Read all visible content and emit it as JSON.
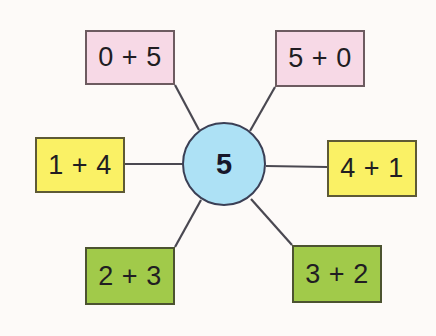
{
  "diagram": {
    "background_color": "#fdfaf8",
    "center": {
      "label": "5",
      "fill_color": "#ade1f5",
      "border_color": "#3b3f55",
      "cx": 224,
      "cy": 164,
      "r": 42
    },
    "edge_color": "#4a4851",
    "nodes": [
      {
        "id": "top-left",
        "label": "0 + 5",
        "addends": [
          0,
          5
        ],
        "sum": 5,
        "fill_color": "#f7d9e6",
        "border_color": "#6d5b60",
        "color_name": "pink",
        "x": 85,
        "y": 30,
        "w": 90,
        "h": 55
      },
      {
        "id": "top-right",
        "label": "5 + 0",
        "addends": [
          5,
          0
        ],
        "sum": 5,
        "fill_color": "#f7d9e6",
        "border_color": "#6d5b60",
        "color_name": "pink",
        "x": 275,
        "y": 30,
        "w": 90,
        "h": 57
      },
      {
        "id": "middle-left",
        "label": "1 + 4",
        "addends": [
          1,
          4
        ],
        "sum": 5,
        "fill_color": "#faf165",
        "border_color": "#5e5a35",
        "color_name": "yellow",
        "x": 35,
        "y": 137,
        "w": 90,
        "h": 56
      },
      {
        "id": "middle-right",
        "label": "4 + 1",
        "addends": [
          4,
          1
        ],
        "sum": 5,
        "fill_color": "#faf165",
        "border_color": "#5e5a35",
        "color_name": "yellow",
        "x": 327,
        "y": 140,
        "w": 90,
        "h": 57
      },
      {
        "id": "bottom-left",
        "label": "2 + 3",
        "addends": [
          2,
          3
        ],
        "sum": 5,
        "fill_color": "#a1ca4a",
        "border_color": "#4c5330",
        "color_name": "green",
        "x": 85,
        "y": 247,
        "w": 90,
        "h": 58
      },
      {
        "id": "bottom-right",
        "label": "3 + 2",
        "addends": [
          3,
          2
        ],
        "sum": 5,
        "fill_color": "#a1ca4a",
        "border_color": "#4c5330",
        "color_name": "green",
        "x": 292,
        "y": 245,
        "w": 90,
        "h": 58
      }
    ],
    "edges": [
      {
        "from": "top-left",
        "to": "center",
        "x1": 175,
        "y1": 85,
        "x2": 199,
        "y2": 130
      },
      {
        "from": "top-right",
        "to": "center",
        "x1": 275,
        "y1": 87,
        "x2": 250,
        "y2": 131
      },
      {
        "from": "middle-left",
        "to": "center",
        "x1": 125,
        "y1": 164,
        "x2": 182,
        "y2": 164
      },
      {
        "from": "middle-right",
        "to": "center",
        "x1": 327,
        "y1": 167,
        "x2": 266,
        "y2": 166
      },
      {
        "from": "bottom-left",
        "to": "center",
        "x1": 175,
        "y1": 247,
        "x2": 201,
        "y2": 200
      },
      {
        "from": "bottom-right",
        "to": "center",
        "x1": 292,
        "y1": 245,
        "x2": 251,
        "y2": 199
      }
    ]
  }
}
